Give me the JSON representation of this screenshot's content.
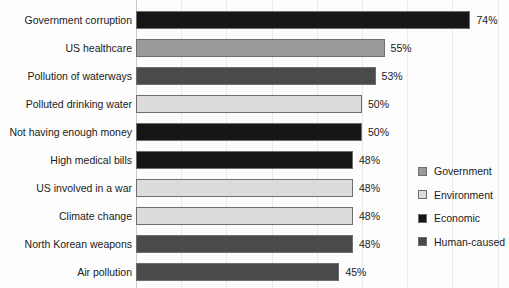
{
  "chart_data": {
    "type": "bar",
    "orientation": "horizontal",
    "title": "",
    "subtitle": "",
    "xlabel": "",
    "ylabel": "",
    "xlim": [
      0,
      80
    ],
    "grid": true,
    "gridlines_every": 10,
    "legend_position": "right",
    "value_suffix": "%",
    "categories": [
      "Government corruption",
      "US healthcare",
      "Pollution of waterways",
      "Polluted drinking water",
      "Not having enough money",
      "High medical bills",
      "US involved in a war",
      "Climate change",
      "North Korean weapons",
      "Air pollution"
    ],
    "values": [
      74,
      55,
      53,
      50,
      50,
      48,
      48,
      48,
      48,
      45
    ],
    "value_labels": [
      "74%",
      "55%",
      "53%",
      "50%",
      "50%",
      "48%",
      "48%",
      "48%",
      "48%",
      "45%"
    ],
    "groups": [
      "Economic",
      "Government",
      "Human-caused",
      "Environment",
      "Economic",
      "Economic",
      "Environment",
      "Environment",
      "Human-caused",
      "Human-caused"
    ],
    "series": [
      {
        "name": "Government",
        "color": "#9a9a9a",
        "points": [
          {
            "category": "US healthcare",
            "value": 55
          }
        ]
      },
      {
        "name": "Environment",
        "color": "#dcdcdc",
        "points": [
          {
            "category": "Polluted drinking water",
            "value": 50
          },
          {
            "category": "US involved in a war",
            "value": 48
          },
          {
            "category": "Climate change",
            "value": 48
          }
        ]
      },
      {
        "name": "Economic",
        "color": "#161616",
        "points": [
          {
            "category": "Government corruption",
            "value": 74
          },
          {
            "category": "Not having enough money",
            "value": 50
          },
          {
            "category": "High medical bills",
            "value": 48
          }
        ]
      },
      {
        "name": "Human-caused",
        "color": "#4a4a4a",
        "points": [
          {
            "category": "Pollution of waterways",
            "value": 53
          },
          {
            "category": "North Korean weapons",
            "value": 48
          },
          {
            "category": "Air pollution",
            "value": 45
          }
        ]
      }
    ]
  },
  "legend": {
    "items": [
      {
        "label": "Government",
        "color": "#9a9a9a"
      },
      {
        "label": "Environment",
        "color": "#dcdcdc"
      },
      {
        "label": "Economic",
        "color": "#161616"
      },
      {
        "label": "Human-caused",
        "color": "#4a4a4a"
      }
    ]
  },
  "colors": {
    "government": "#9a9a9a",
    "environment": "#dcdcdc",
    "economic": "#161616",
    "human_caused": "#4a4a4a",
    "grid": "#e9e9e9",
    "bar_outline": "#6e6e6e",
    "text": "#1a1a1a",
    "background": "#fdfdfd"
  }
}
